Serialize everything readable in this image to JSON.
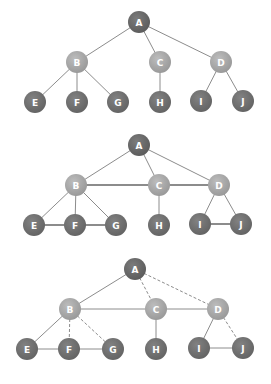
{
  "colors": {
    "root": "#6a6a6a",
    "mid": "#a9a9a9",
    "leaf": "#747474",
    "edge": "#8c8c8c",
    "label": "#ffffff"
  },
  "diagrams": [
    {
      "name": "tree",
      "nodes": [
        {
          "id": "A",
          "level": "root"
        },
        {
          "id": "B",
          "level": "mid"
        },
        {
          "id": "C",
          "level": "mid"
        },
        {
          "id": "D",
          "level": "mid"
        },
        {
          "id": "E",
          "level": "leaf"
        },
        {
          "id": "F",
          "level": "leaf"
        },
        {
          "id": "G",
          "level": "leaf"
        },
        {
          "id": "H",
          "level": "leaf"
        },
        {
          "id": "I",
          "level": "leaf"
        },
        {
          "id": "J",
          "level": "leaf"
        }
      ],
      "edges": [
        {
          "from": "A",
          "to": "B",
          "style": "solid"
        },
        {
          "from": "A",
          "to": "C",
          "style": "solid"
        },
        {
          "from": "A",
          "to": "D",
          "style": "solid"
        },
        {
          "from": "B",
          "to": "E",
          "style": "solid"
        },
        {
          "from": "B",
          "to": "F",
          "style": "solid"
        },
        {
          "from": "B",
          "to": "G",
          "style": "solid"
        },
        {
          "from": "C",
          "to": "H",
          "style": "solid"
        },
        {
          "from": "D",
          "to": "I",
          "style": "solid"
        },
        {
          "from": "D",
          "to": "J",
          "style": "solid"
        }
      ]
    },
    {
      "name": "graph",
      "nodes": [
        {
          "id": "A",
          "level": "root"
        },
        {
          "id": "B",
          "level": "mid"
        },
        {
          "id": "C",
          "level": "mid"
        },
        {
          "id": "D",
          "level": "mid"
        },
        {
          "id": "E",
          "level": "leaf"
        },
        {
          "id": "F",
          "level": "leaf"
        },
        {
          "id": "G",
          "level": "leaf"
        },
        {
          "id": "H",
          "level": "leaf"
        },
        {
          "id": "I",
          "level": "leaf"
        },
        {
          "id": "J",
          "level": "leaf"
        }
      ],
      "edges": [
        {
          "from": "A",
          "to": "B",
          "style": "solid"
        },
        {
          "from": "A",
          "to": "C",
          "style": "solid"
        },
        {
          "from": "A",
          "to": "D",
          "style": "solid"
        },
        {
          "from": "B",
          "to": "C",
          "style": "bold"
        },
        {
          "from": "C",
          "to": "D",
          "style": "bold"
        },
        {
          "from": "B",
          "to": "E",
          "style": "solid"
        },
        {
          "from": "B",
          "to": "F",
          "style": "solid"
        },
        {
          "from": "B",
          "to": "G",
          "style": "solid"
        },
        {
          "from": "C",
          "to": "H",
          "style": "solid"
        },
        {
          "from": "D",
          "to": "I",
          "style": "solid"
        },
        {
          "from": "D",
          "to": "J",
          "style": "solid"
        },
        {
          "from": "E",
          "to": "F",
          "style": "bold"
        },
        {
          "from": "F",
          "to": "G",
          "style": "bold"
        },
        {
          "from": "I",
          "to": "J",
          "style": "bold"
        }
      ]
    },
    {
      "name": "spanning-tree",
      "nodes": [
        {
          "id": "A",
          "level": "root"
        },
        {
          "id": "B",
          "level": "mid"
        },
        {
          "id": "C",
          "level": "mid"
        },
        {
          "id": "D",
          "level": "mid"
        },
        {
          "id": "E",
          "level": "leaf"
        },
        {
          "id": "F",
          "level": "leaf"
        },
        {
          "id": "G",
          "level": "leaf"
        },
        {
          "id": "H",
          "level": "leaf"
        },
        {
          "id": "I",
          "level": "leaf"
        },
        {
          "id": "J",
          "level": "leaf"
        }
      ],
      "edges": [
        {
          "from": "A",
          "to": "B",
          "style": "solid"
        },
        {
          "from": "A",
          "to": "C",
          "style": "dashed"
        },
        {
          "from": "A",
          "to": "D",
          "style": "dashed"
        },
        {
          "from": "B",
          "to": "C",
          "style": "solid"
        },
        {
          "from": "C",
          "to": "D",
          "style": "solid"
        },
        {
          "from": "B",
          "to": "E",
          "style": "solid"
        },
        {
          "from": "B",
          "to": "F",
          "style": "dashed"
        },
        {
          "from": "B",
          "to": "G",
          "style": "dashed"
        },
        {
          "from": "C",
          "to": "H",
          "style": "solid"
        },
        {
          "from": "D",
          "to": "I",
          "style": "solid"
        },
        {
          "from": "D",
          "to": "J",
          "style": "dashed"
        },
        {
          "from": "E",
          "to": "F",
          "style": "solid"
        },
        {
          "from": "F",
          "to": "G",
          "style": "solid"
        },
        {
          "from": "I",
          "to": "J",
          "style": "solid"
        }
      ]
    }
  ]
}
